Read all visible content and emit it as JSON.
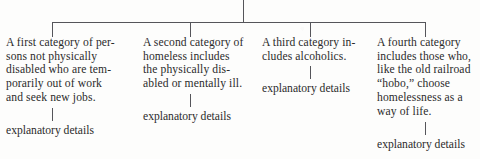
{
  "diagram": {
    "type": "tree-diagram",
    "title_text": "",
    "line_color": "#55555a",
    "text_color": "#2b2b2b",
    "background_color": "#fdfdfc",
    "root": {
      "label": "",
      "stem_x": 243
    },
    "branches": [
      {
        "id": "branch-1",
        "connector_x": 52,
        "lines": [
          "A first category of per-",
          "sons not physically",
          "disabled who are tem-",
          "porarily out of work",
          "and seek new jobs."
        ],
        "detail_label": "explanatory details"
      },
      {
        "id": "branch-2",
        "connector_x": 190,
        "lines": [
          "A second category of",
          "homeless includes",
          "the physically dis-",
          "abled or mentally ill."
        ],
        "detail_label": "explanatory details"
      },
      {
        "id": "branch-3",
        "connector_x": 310,
        "lines": [
          "A third category in-",
          "cludes alcoholics."
        ],
        "detail_label": "explanatory details"
      },
      {
        "id": "branch-4",
        "connector_x": 425,
        "lines": [
          "A fourth category",
          "includes those who,",
          "like the old railroad",
          "“hobo,” choose",
          "homelessness as a",
          "way of life."
        ],
        "detail_label": "explanatory details"
      }
    ]
  }
}
